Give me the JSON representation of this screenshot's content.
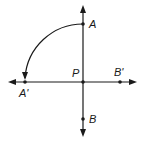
{
  "diagram": {
    "center": {
      "label": "P",
      "x": 83,
      "y": 82
    },
    "points": [
      {
        "label": "A",
        "x": 83,
        "y": 24,
        "label_x": 90,
        "label_y": 28
      },
      {
        "label": "A'",
        "x": 25,
        "y": 82,
        "label_x": 18,
        "label_y": 98
      },
      {
        "label": "B'",
        "x": 120,
        "y": 82,
        "label_x": 114,
        "label_y": 76
      },
      {
        "label": "B",
        "x": 83,
        "y": 119,
        "label_x": 90,
        "label_y": 123
      }
    ],
    "p_label": {
      "text": "P",
      "x": 73,
      "y": 76
    },
    "colors": {
      "stroke": "#1a1a1a",
      "background": "#ffffff"
    }
  }
}
